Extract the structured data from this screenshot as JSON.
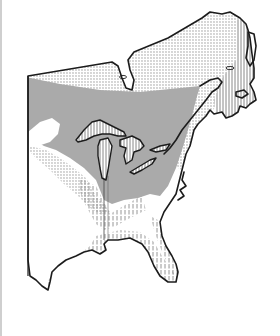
{
  "map": {
    "type": "species-range-map",
    "region": "eastern North America",
    "colors": {
      "background": "#ffffff",
      "outline": "#1c1c1c",
      "light_stipple": "#9a9a9a",
      "dense_stipple": "#6e6e6e",
      "hatch": "#7a7a7a",
      "frame_rule": "#cfcfcf"
    },
    "legend": [],
    "zones": [
      {
        "id": "light-stipple",
        "description": "northern range (light dotted)"
      },
      {
        "id": "dense-stipple",
        "description": "core range around Great Lakes (dense dotted)"
      },
      {
        "id": "vertical-hatch",
        "description": "coastal / southern range (vertical hatching)"
      }
    ]
  }
}
